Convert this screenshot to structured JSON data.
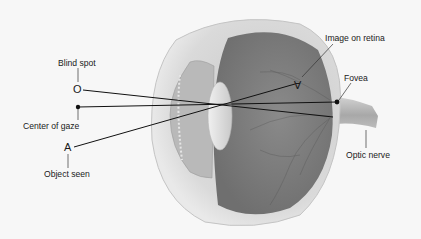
{
  "diagram": {
    "labels": {
      "blind_spot": "Blind spot",
      "center_of_gaze": "Center of gaze",
      "object_seen": "Object seen",
      "image_on_retina": "Image on retina",
      "fovea": "Fovea",
      "optic_nerve": "Optic nerve"
    },
    "markers": {
      "blind_spot_symbol": "O",
      "object_symbol": "A",
      "retina_image_symbol": "A"
    },
    "colors": {
      "background": "#f7f7f7",
      "line": "#111111",
      "eye_outer": "#d8d8d8",
      "eye_inner": "#7f7f7f",
      "lens": "#e6e6e6"
    }
  }
}
